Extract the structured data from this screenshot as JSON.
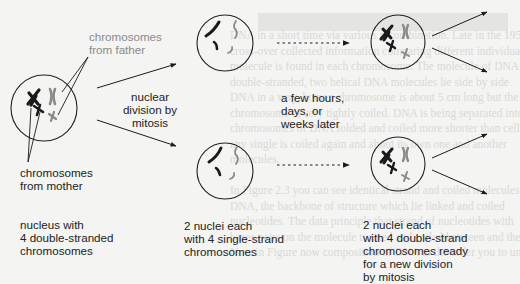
{
  "diagram": {
    "title": "Nuclear division by mitosis",
    "colors": {
      "background": "#f4f4f2",
      "ink": "#1a1a1a",
      "father_chromosomes": "#8a8a8a",
      "mother_chromosomes": "#1a1a1a",
      "bleed_through_text": "#d9d9d6"
    },
    "callouts": {
      "father": [
        "chromosomes",
        "from father"
      ],
      "mother": [
        "chromosomes",
        "from mother"
      ]
    },
    "arrow_labels": {
      "mitosis": [
        "nuclear",
        "division by",
        "mitosis"
      ],
      "time_delay": [
        "a few hours,",
        "days, or",
        "weeks later"
      ]
    },
    "stages": [
      {
        "id": "start",
        "caption": [
          "nucleus with",
          "4 double-stranded",
          "chromosomes"
        ],
        "nuclei_count": 1,
        "chromosome_type": "double-stranded"
      },
      {
        "id": "after-division",
        "caption": [
          "2 nuclei each",
          "with 4 single-strand",
          "chromosomes"
        ],
        "nuclei_count": 2,
        "chromosome_type": "single-strand"
      },
      {
        "id": "after-replication",
        "caption": [
          "2 nuclei each",
          "with 4 double-strand",
          "chromosomes ready",
          "for a new division",
          "by mitosis"
        ],
        "nuclei_count": 2,
        "chromosome_type": "double-strand"
      }
    ],
    "bleed_through_lines": [
      "DNA in a short time via various recombination. Late in the 1950s",
      "cross-over collected information comparing different individuals. A",
      "molecule is found in each chromosome. The molecule of DNA is",
      "double-stranded, two helical DNA molecules lie side by side",
      "DNA in a very, human chromosome is about 5 cm long but the",
      "chromosome is very tightly coiled. DNA is being separated into",
      "chromosomes of DNA folded and coiled more shorter than cell.",
      "any single is coiled again and about its own one and another",
      "molecules.",
      "",
      "In Figure 2.3 you can see identical strand and coiled molecules of",
      "DNA, the backbone of structure which lie linked and coiled",
      "nucleotides. The data principle that strand of nucleotides with",
      "bases pairs on the molecule twisted and coiled between and them",
      "Now in Figure now composition of DNA to the order you to understand"
    ]
  }
}
